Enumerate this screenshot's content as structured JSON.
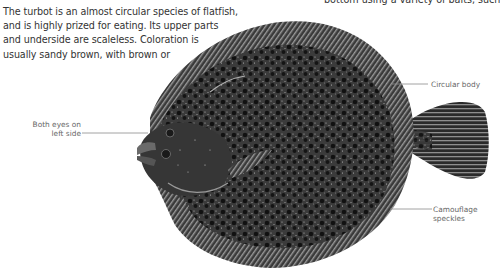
{
  "intro": {
    "lines": [
      "The turbot is an almost circular species of flatfish,",
      "and is highly prized for eating. Its upper parts",
      "and underside are scaleless. Coloration is",
      "usually sandy brown, with brown or"
    ]
  },
  "top_right_text": "bottom using a variety of baits, such",
  "illustration": {
    "subject": "turbot-flatfish",
    "colors": {
      "body": "#2e2e2e",
      "speckle": "#111111",
      "fin": "#4a4a4a",
      "highlight": "#cfcfcf"
    }
  },
  "labels": [
    {
      "id": "circular-body",
      "lines": [
        "Circular body"
      ]
    },
    {
      "id": "eyes",
      "lines": [
        "Both eyes on",
        "left side"
      ]
    },
    {
      "id": "camouflage",
      "lines": [
        "Camouflage",
        "speckles"
      ]
    }
  ]
}
